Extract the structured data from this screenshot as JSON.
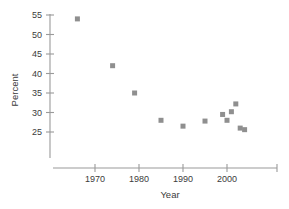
{
  "chart_data": {
    "type": "scatter",
    "title": "",
    "xlabel": "Year",
    "ylabel": "Percent",
    "xlim": [
      1962,
      2009
    ],
    "ylim": [
      21,
      57
    ],
    "grid": false,
    "legend": null,
    "xticks": [
      1970,
      1980,
      1990,
      2000
    ],
    "xtick_labels": [
      "1970",
      "1980",
      "1990",
      "2000"
    ],
    "yticks": [
      25,
      30,
      35,
      40,
      45,
      50,
      55
    ],
    "ytick_labels": [
      "25",
      "30",
      "35",
      "40",
      "45",
      "50",
      "55"
    ],
    "marker_color": "#8f8f8f",
    "marker_shape": "square",
    "series": [
      {
        "name": "Percent by Year",
        "points": [
          {
            "x": 1966,
            "y": 54.0
          },
          {
            "x": 1974,
            "y": 42.0
          },
          {
            "x": 1979,
            "y": 35.0
          },
          {
            "x": 1985,
            "y": 28.0
          },
          {
            "x": 1990,
            "y": 26.5
          },
          {
            "x": 1995,
            "y": 27.8
          },
          {
            "x": 1999,
            "y": 29.5
          },
          {
            "x": 2000,
            "y": 28.0
          },
          {
            "x": 2001,
            "y": 30.2
          },
          {
            "x": 2002,
            "y": 32.2
          },
          {
            "x": 2003,
            "y": 26.0
          },
          {
            "x": 2004,
            "y": 25.6
          }
        ]
      }
    ]
  },
  "axes": {
    "x_title": "Year",
    "y_title": "Percent"
  }
}
